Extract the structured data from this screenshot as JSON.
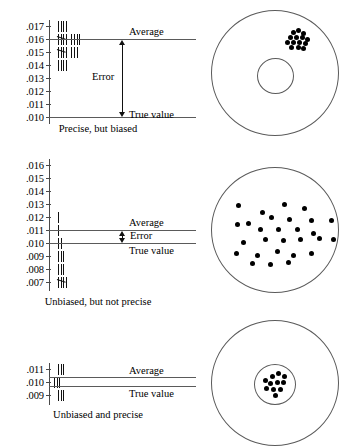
{
  "figure": {
    "title": "",
    "colors": {
      "ink": "#000000",
      "rule": "#5a5a5a",
      "dot": "#000000"
    }
  },
  "chart_data": [
    {
      "type": "table",
      "id": "panel-1",
      "title": "Precise, but biased",
      "xlabel": "",
      "ylabel": "",
      "categories": [
        ".017",
        ".016",
        ".015",
        ".014",
        ".013",
        ".012",
        ".011",
        ".010"
      ],
      "values": [
        4,
        9,
        8,
        4,
        0,
        0,
        0,
        0
      ],
      "tally_groups": [
        [
          4
        ],
        [
          5,
          4
        ],
        [
          5,
          3
        ],
        [
          4
        ],
        [],
        [],
        [],
        []
      ],
      "annotations": [
        {
          "label": "Average",
          "value": ".016"
        },
        {
          "label": "Error",
          "value": ""
        },
        {
          "label": "True value",
          "value": ".010"
        }
      ]
    },
    {
      "type": "table",
      "id": "panel-2",
      "title": "Unbiased, but not precise",
      "xlabel": "",
      "ylabel": "",
      "categories": [
        ".016",
        ".015",
        ".014",
        ".013",
        ".012",
        ".011",
        ".010",
        ".009",
        ".008",
        ".007"
      ],
      "values": [
        1,
        1,
        2,
        3,
        3,
        5,
        3,
        3,
        3,
        1
      ],
      "tally_groups": [
        [
          1
        ],
        [
          1
        ],
        [
          2
        ],
        [
          3
        ],
        [
          3
        ],
        [
          5
        ],
        [
          3
        ],
        [
          3
        ],
        [
          3
        ],
        [
          1
        ]
      ],
      "annotations": [
        {
          "label": "Average",
          "value": ".011"
        },
        {
          "label": "Error",
          "value": ""
        },
        {
          "label": "True value",
          "value": ".010"
        }
      ]
    },
    {
      "type": "table",
      "id": "panel-3",
      "title": "Unbiased and precise",
      "xlabel": "",
      "ylabel": "",
      "categories": [
        ".011",
        ".010",
        ".009"
      ],
      "values": [
        7,
        11,
        7
      ],
      "tally_groups": [
        [
          5,
          2
        ],
        [
          5,
          5,
          1
        ],
        [
          5,
          2
        ]
      ],
      "annotations": [
        {
          "label": "Average",
          "value": ".010"
        },
        {
          "label": "True value",
          "value": ".010"
        }
      ]
    }
  ],
  "panels": [
    {
      "id": "precise-biased",
      "caption": "Precise, but biased",
      "tick_labels": [
        ".017",
        ".016",
        ".015",
        ".014",
        ".013",
        ".012",
        ".011",
        ".010"
      ],
      "average_label": "Average",
      "error_label": "Error",
      "true_value_label": "True value",
      "target": {
        "rings": 2,
        "dot_count": 13,
        "pattern": "tight-cluster-off-center"
      }
    },
    {
      "id": "unbiased-not-precise",
      "caption": "Unbiased, but not precise",
      "tick_labels": [
        ".016",
        ".015",
        ".014",
        ".013",
        ".012",
        ".011",
        ".010",
        ".009",
        ".008",
        ".007"
      ],
      "average_label": "Average",
      "error_label": "Error",
      "true_value_label": "True value",
      "target": {
        "rings": 1,
        "dot_count": 28,
        "pattern": "scattered"
      }
    },
    {
      "id": "unbiased-precise",
      "caption": "Unbiased and precise",
      "tick_labels": [
        ".011",
        ".010",
        ".009"
      ],
      "average_label": "Average",
      "error_label": "",
      "true_value_label": "True value",
      "target": {
        "rings": 2,
        "dot_count": 11,
        "pattern": "tight-cluster-center"
      }
    }
  ]
}
